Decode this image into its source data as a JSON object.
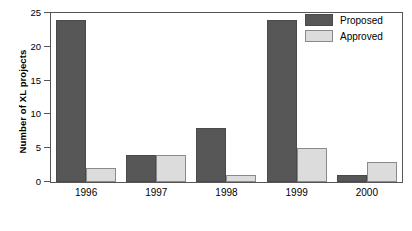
{
  "chart_data": {
    "type": "bar",
    "title": "",
    "subtitle": "",
    "xlabel": "",
    "ylabel": "Number of XL projects",
    "categories": [
      "1996",
      "1997",
      "1998",
      "1999",
      "2000"
    ],
    "series": [
      {
        "name": "Proposed",
        "values": [
          24,
          4,
          8,
          24,
          1
        ],
        "color": "#575757"
      },
      {
        "name": "Approved",
        "values": [
          2,
          4,
          1,
          5,
          3
        ],
        "color": "#dcdcdc"
      }
    ],
    "ylim": [
      0,
      25
    ],
    "yticks": [
      0,
      5,
      10,
      15,
      20,
      25
    ],
    "ytick_labels": [
      "0",
      "5",
      "10",
      "15",
      "20",
      "25"
    ],
    "grid": false,
    "legend_position": "top-right",
    "annotations": []
  },
  "legend": {
    "items": [
      {
        "label": "Proposed",
        "swatch": "proposed"
      },
      {
        "label": "Approved",
        "swatch": "approved"
      }
    ]
  },
  "axes": {
    "y_title": "Number of XL projects"
  }
}
